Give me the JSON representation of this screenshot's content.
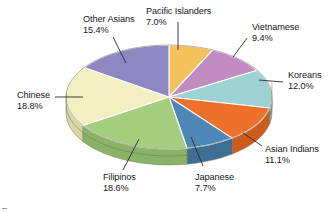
{
  "chart_data": {
    "type": "pie",
    "title": "",
    "subtitle": "",
    "xlabel": "",
    "ylabel": "",
    "legend_position": "callout-labels",
    "grid": false,
    "style": "3d-exploded-none",
    "units": "percent",
    "categories": [
      "Pacific Islanders",
      "Vietnamese",
      "Koreans",
      "Asian Indians",
      "Japanese",
      "Filipinos",
      "Chinese",
      "Other Asians"
    ],
    "values": [
      7.0,
      9.4,
      12.0,
      11.1,
      7.7,
      18.6,
      18.8,
      15.4
    ],
    "value_labels": [
      "7.0%",
      "9.4%",
      "12.0%",
      "11.1%",
      "7.7%",
      "18.6%",
      "18.8%",
      "15.4%"
    ],
    "colors": [
      "#f5c15a",
      "#c48ac2",
      "#9ed1d4",
      "#ef7028",
      "#4e87b5",
      "#a5cd7e",
      "#f2f0c0",
      "#8f87c4"
    ],
    "slices": [
      {
        "label": "Pacific Islanders",
        "value": 7.0,
        "value_label": "7.0%",
        "color": "#f5c15a",
        "side_color": "#dba84a"
      },
      {
        "label": "Vietnamese",
        "value": 9.4,
        "value_label": "9.4%",
        "color": "#c48ac2",
        "side_color": "#a9739f"
      },
      {
        "label": "Koreans",
        "value": 12.0,
        "value_label": "12.0%",
        "color": "#9ed1d4",
        "side_color": "#84b7bb"
      },
      {
        "label": "Asian Indians",
        "value": 11.1,
        "value_label": "11.1%",
        "color": "#ef7028",
        "side_color": "#d25a19"
      },
      {
        "label": "Japanese",
        "value": 7.7,
        "value_label": "7.7%",
        "color": "#4e87b5",
        "side_color": "#3c6e98"
      },
      {
        "label": "Filipinos",
        "value": 18.6,
        "value_label": "18.6%",
        "color": "#a5cd7e",
        "side_color": "#89b365"
      },
      {
        "label": "Chinese",
        "value": 18.8,
        "value_label": "18.8%",
        "color": "#f2f0c0",
        "side_color": "#d9d6a3"
      },
      {
        "label": "Other Asians",
        "value": 15.4,
        "value_label": "15.4%",
        "color": "#8f87c4",
        "side_color": "#7971ab"
      }
    ]
  },
  "labels": {
    "pacific_islanders": {
      "name": "Pacific Islanders",
      "percent": "7.0%"
    },
    "vietnamese": {
      "name": "Vietnamese",
      "percent": "9.4%"
    },
    "koreans": {
      "name": "Koreans",
      "percent": "12.0%"
    },
    "asian_indians": {
      "name": "Asian Indians",
      "percent": "11.1%"
    },
    "japanese": {
      "name": "Japanese",
      "percent": "7.7%"
    },
    "filipinos": {
      "name": "Filipinos",
      "percent": "18.6%"
    },
    "chinese": {
      "name": "Chinese",
      "percent": "18.8%"
    },
    "other_asians": {
      "name": "Other Asians",
      "percent": "15.4%"
    }
  }
}
